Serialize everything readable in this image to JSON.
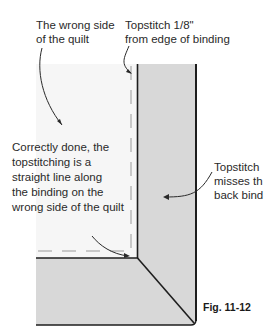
{
  "figure": {
    "caption": "Fig. 11-12",
    "colors": {
      "background": "#ffffff",
      "quilt_wrong_side": "#f6f6f6",
      "binding": "#d8d8d8",
      "outline": "#1e1e1e",
      "topstitch_dash": "#c8c8c8",
      "text": "#2a2a2a"
    }
  },
  "labels": {
    "wrong_side": "The wrong side\nof the quilt",
    "topstitch_edge": "Topstitch 1/8\"\nfrom edge of binding",
    "correctly_done": "Correctly done, the\ntopstitching is a\nstraight line along\nthe binding on the\nwrong side of the quilt",
    "topstitch_misses": "Topstitch\nmisses th\nback bind"
  }
}
